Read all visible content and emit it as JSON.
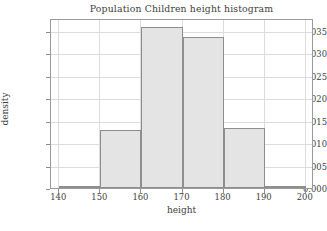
{
  "chart_data": {
    "type": "bar",
    "title": "Population Children height histogram",
    "xlabel": "height",
    "ylabel": "density",
    "categories": [
      "140-150",
      "150-160",
      "160-170",
      "170-180",
      "180-190",
      "190-200"
    ],
    "bin_edges": [
      140,
      150,
      160,
      170,
      180,
      190,
      200
    ],
    "values": [
      0.0004,
      0.013,
      0.036,
      0.0337,
      0.0134,
      0.0002
    ],
    "xlim": [
      138,
      202
    ],
    "ylim": [
      0.0,
      0.0379
    ],
    "xticks": [
      140,
      150,
      160,
      170,
      180,
      190,
      200
    ],
    "xtick_labels": [
      "140",
      "150",
      "160",
      "170",
      "180",
      "190",
      "200"
    ],
    "yticks": [
      0.0,
      0.005,
      0.01,
      0.015,
      0.02,
      0.025,
      0.03,
      0.035
    ],
    "ytick_labels": [
      "0.000",
      "0.005",
      "0.010",
      "0.015",
      "0.020",
      "0.025",
      "0.030",
      "0.035"
    ],
    "grid": true,
    "legend": null,
    "bar_fill_color": "#e4e4e4",
    "bar_edge_color": "#8e8e8e",
    "grid_color": "#dcdcdc",
    "axes_color": "#9a9a9a",
    "text_color": "#3d3d3d",
    "background_color": "#ffffff"
  }
}
